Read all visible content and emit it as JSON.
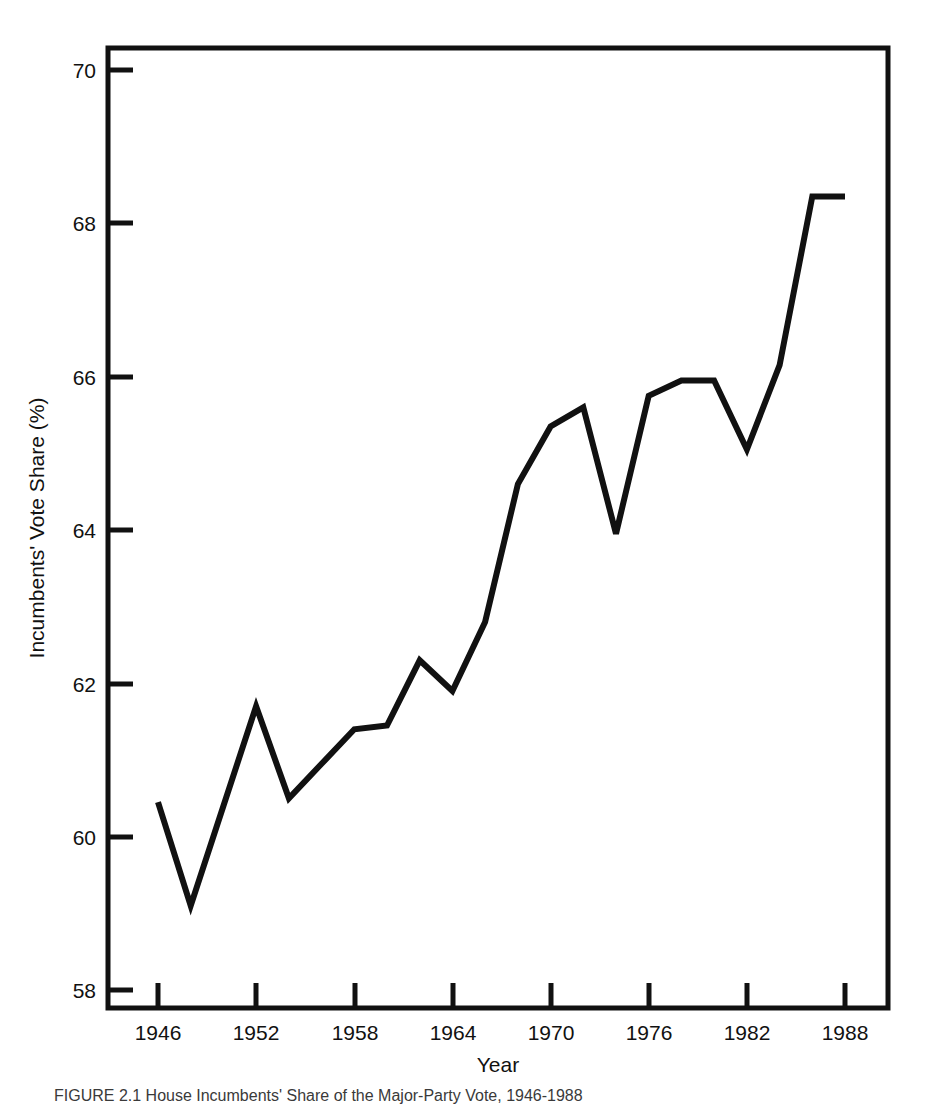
{
  "figure": {
    "caption": "FIGURE 2.1  House Incumbents' Share of the Major-Party Vote, 1946-1988",
    "background_color": "#ffffff",
    "line_color": "#111111",
    "axis_color": "#111111"
  },
  "chart_data": {
    "type": "line",
    "title": "",
    "xlabel": "Year",
    "ylabel": "Incumbents' Vote Share (%)",
    "xlim": [
      1944,
      1990
    ],
    "ylim": [
      58,
      70
    ],
    "grid": false,
    "legend": "none",
    "xticks": [
      1946,
      1952,
      1958,
      1964,
      1970,
      1976,
      1982,
      1988
    ],
    "yticks": [
      58,
      60,
      62,
      64,
      66,
      68,
      70
    ],
    "x": [
      1946,
      1948,
      1950,
      1952,
      1954,
      1956,
      1958,
      1960,
      1962,
      1964,
      1966,
      1968,
      1970,
      1972,
      1974,
      1976,
      1978,
      1980,
      1982,
      1984,
      1986,
      1988
    ],
    "series": [
      {
        "name": "Incumbents' Vote Share",
        "values": [
          60.45,
          59.1,
          60.4,
          61.7,
          60.5,
          60.95,
          61.4,
          61.45,
          62.3,
          61.9,
          62.8,
          64.6,
          65.35,
          65.6,
          63.95,
          65.75,
          65.95,
          65.95,
          65.05,
          66.15,
          68.35,
          68.35
        ]
      }
    ]
  },
  "axis": {
    "y_tick_labels": [
      "70",
      "68",
      "66",
      "64",
      "62",
      "60",
      "58"
    ],
    "x_tick_labels": [
      "1946",
      "1952",
      "1958",
      "1964",
      "1970",
      "1976",
      "1982",
      "1988"
    ],
    "x_title": "Year",
    "y_title": "Incumbents' Vote Share (%)"
  }
}
